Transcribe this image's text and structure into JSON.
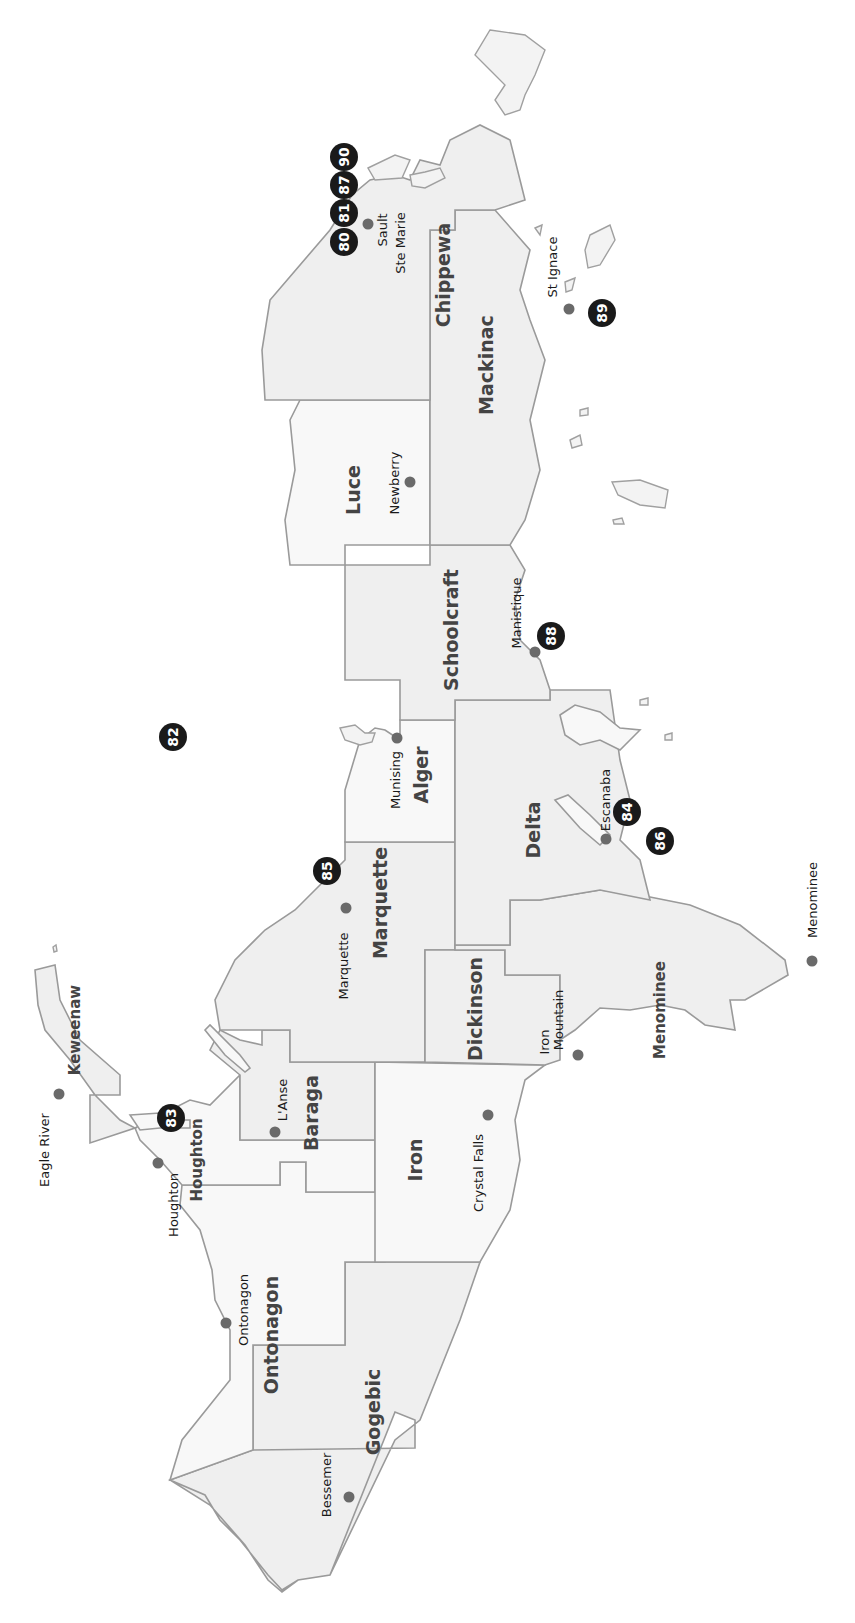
{
  "map": {
    "title": "Upper Peninsula of Michigan",
    "orientation": "rotated 90 degrees counter-clockwise",
    "colors": {
      "land": "#efefef",
      "county_border": "#555555",
      "coastline": "#9a9a9a",
      "city_dot": "#6a6a6a",
      "marker": "#1a1a1a"
    },
    "counties": [
      {
        "name": "Keweenaw"
      },
      {
        "name": "Houghton"
      },
      {
        "name": "Ontonagon"
      },
      {
        "name": "Gogebic"
      },
      {
        "name": "Baraga"
      },
      {
        "name": "Iron"
      },
      {
        "name": "Marquette"
      },
      {
        "name": "Dickinson"
      },
      {
        "name": "Menominee"
      },
      {
        "name": "Alger"
      },
      {
        "name": "Delta"
      },
      {
        "name": "Schoolcraft"
      },
      {
        "name": "Luce"
      },
      {
        "name": "Mackinac"
      },
      {
        "name": "Chippewa"
      }
    ],
    "cities": [
      {
        "name": "Eagle River"
      },
      {
        "name": "Houghton"
      },
      {
        "name": "L'Anse"
      },
      {
        "name": "Ontonagon"
      },
      {
        "name": "Bessemer"
      },
      {
        "name": "Crystal Falls"
      },
      {
        "name": "Iron Mountain",
        "line1": "Iron",
        "line2": "Mountain"
      },
      {
        "name": "Marquette"
      },
      {
        "name": "Menominee"
      },
      {
        "name": "Escanaba"
      },
      {
        "name": "Munising"
      },
      {
        "name": "Manistique"
      },
      {
        "name": "Newberry"
      },
      {
        "name": "St Ignace"
      },
      {
        "name": "Sault Ste Marie",
        "line1": "Sault",
        "line2": "Ste Marie"
      }
    ],
    "markers": [
      {
        "number": "80"
      },
      {
        "number": "81"
      },
      {
        "number": "82"
      },
      {
        "number": "83"
      },
      {
        "number": "84"
      },
      {
        "number": "85"
      },
      {
        "number": "86"
      },
      {
        "number": "87"
      },
      {
        "number": "88"
      },
      {
        "number": "89"
      },
      {
        "number": "90"
      }
    ]
  }
}
